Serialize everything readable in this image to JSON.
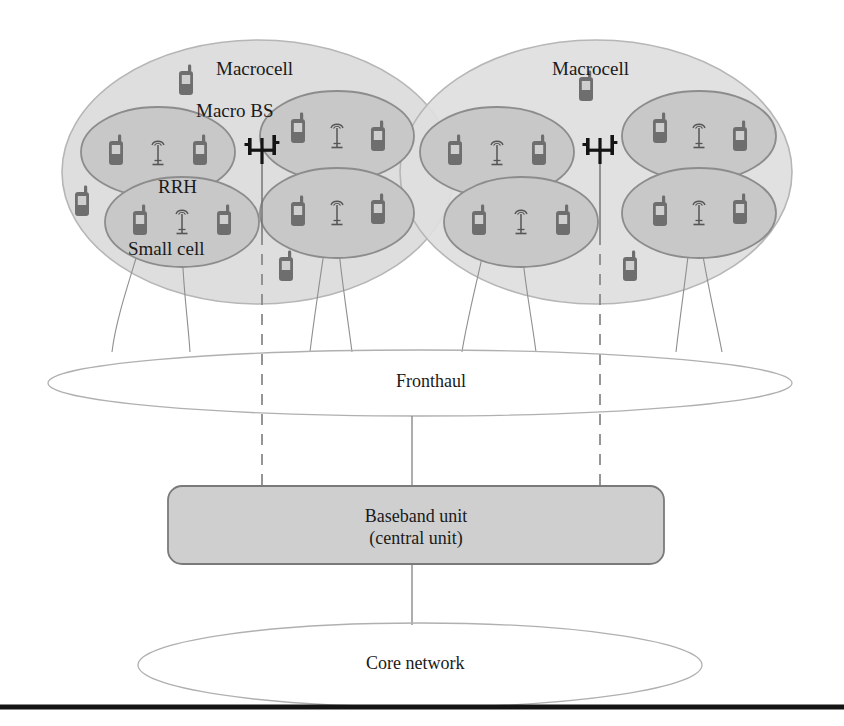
{
  "diagram": {
    "labels": {
      "macrocell_left": "Macrocell",
      "macrocell_right": "Macrocell",
      "macro_bs": "Macro BS",
      "rrh": "RRH",
      "small_cell": "Small cell",
      "fronthaul": "Fronthaul",
      "baseband_unit_line1": "Baseband unit",
      "baseband_unit_line2": "(central unit)",
      "core_network": "Core network"
    },
    "colors": {
      "macrocell_fill": "#dedede",
      "macrocell_stroke": "#b4b4b4",
      "smallcell_fill": "#c8c8c8",
      "smallcell_stroke": "#8c8c8c",
      "bbu_fill": "#cfcfcf",
      "bbu_stroke": "#7a7a7a",
      "ellipse_stroke": "#b0b0b0",
      "link_line": "#8a8a8a",
      "dashed_line": "#8a8a8a",
      "tower_black": "#141414",
      "handset_body": "#6e6e6e",
      "handset_screen": "#cfcfcf",
      "bottom_rule": "#141414"
    },
    "nodes": {
      "macrocells": [
        {
          "name": "macrocell-left",
          "cx": 258,
          "cy": 172,
          "rx": 196,
          "ry": 132,
          "label": "Macrocell"
        },
        {
          "name": "macrocell-right",
          "cx": 596,
          "cy": 172,
          "rx": 196,
          "ry": 132,
          "label": "Macrocell"
        }
      ],
      "small_cells": [
        {
          "name": "small-cell-1",
          "cx": 158,
          "cy": 152,
          "rx": 77,
          "ry": 45,
          "rrh_x": 158,
          "rrh_y": 155
        },
        {
          "name": "small-cell-2",
          "cx": 182,
          "cy": 222,
          "rx": 77,
          "ry": 45,
          "rrh_x": 182,
          "rrh_y": 224
        },
        {
          "name": "small-cell-3",
          "cx": 337,
          "cy": 136,
          "rx": 77,
          "ry": 45,
          "rrh_x": 337,
          "rrh_y": 138
        },
        {
          "name": "small-cell-4",
          "cx": 337,
          "cy": 213,
          "rx": 77,
          "ry": 45,
          "rrh_x": 337,
          "rrh_y": 215
        },
        {
          "name": "small-cell-5",
          "cx": 497,
          "cy": 152,
          "rx": 77,
          "ry": 45,
          "rrh_x": 497,
          "rrh_y": 155
        },
        {
          "name": "small-cell-6",
          "cx": 521,
          "cy": 222,
          "rx": 77,
          "ry": 45,
          "rrh_x": 521,
          "rrh_y": 224
        },
        {
          "name": "small-cell-7",
          "cx": 699,
          "cy": 136,
          "rx": 77,
          "ry": 45,
          "rrh_x": 699,
          "rrh_y": 138
        },
        {
          "name": "small-cell-8",
          "cx": 699,
          "cy": 213,
          "rx": 77,
          "ry": 45,
          "rrh_x": 699,
          "rrh_y": 215
        }
      ],
      "macro_bs_towers": [
        {
          "name": "macro-bs-left",
          "x": 262,
          "y": 152
        },
        {
          "name": "macro-bs-right",
          "x": 600,
          "y": 152
        }
      ],
      "handsets_in_small_cells": [
        {
          "x": 116,
          "y": 152
        },
        {
          "x": 200,
          "y": 152
        },
        {
          "x": 140,
          "y": 222
        },
        {
          "x": 224,
          "y": 222
        },
        {
          "x": 296,
          "y": 132
        },
        {
          "x": 378,
          "y": 136
        },
        {
          "x": 296,
          "y": 213
        },
        {
          "x": 378,
          "y": 213
        },
        {
          "x": 455,
          "y": 152
        },
        {
          "x": 539,
          "y": 152
        },
        {
          "x": 479,
          "y": 222
        },
        {
          "x": 563,
          "y": 222
        },
        {
          "x": 658,
          "y": 132
        },
        {
          "x": 740,
          "y": 136
        },
        {
          "x": 658,
          "y": 213
        },
        {
          "x": 740,
          "y": 213
        }
      ],
      "handsets_in_macrocells": [
        {
          "x": 186,
          "y": 82
        },
        {
          "x": 82,
          "y": 203
        },
        {
          "x": 286,
          "y": 268
        },
        {
          "x": 586,
          "y": 88
        },
        {
          "x": 630,
          "y": 268
        }
      ],
      "fronthaul_ellipse": {
        "cx": 420,
        "cy": 383,
        "rx": 372,
        "ry": 33
      },
      "baseband_unit_box": {
        "x": 168,
        "y": 486,
        "w": 496,
        "h": 78,
        "r": 14
      },
      "core_network_ellipse": {
        "cx": 420,
        "cy": 665,
        "rx": 282,
        "ry": 42
      },
      "bottom_rule": {
        "x1": 0,
        "y1": 707,
        "x2": 844,
        "y2": 707,
        "width": 5
      }
    },
    "links": {
      "fronthaul_to_bbu_solid": {
        "x": 412,
        "y1": 416,
        "y2": 486
      },
      "bbu_to_core_solid": {
        "x": 412,
        "y1": 564,
        "y2": 623
      },
      "dashed_verticals": [
        {
          "name": "dashed-link-left",
          "x": 262,
          "y1": 170,
          "y2": 486
        },
        {
          "name": "dashed-link-right",
          "x": 600,
          "y1": 170,
          "y2": 486
        }
      ],
      "rrh_fronthaul_curves": 8
    }
  }
}
